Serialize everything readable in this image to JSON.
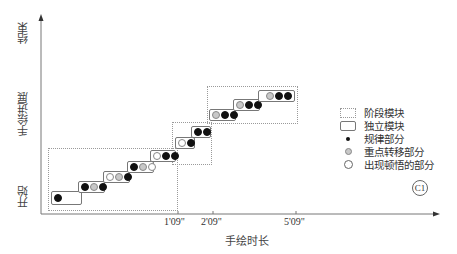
{
  "diagram": {
    "y_axis": {
      "top_label": "结束",
      "middle_label": "手绘进展",
      "bottom_label": "开始"
    },
    "x_axis": {
      "label": "手绘时长",
      "ticks": [
        "1'09\"",
        "2'09\"",
        "5'09\""
      ]
    },
    "legend": {
      "items": [
        {
          "symbol": "dotted-rect",
          "label": "阶段模块"
        },
        {
          "symbol": "solid-rect",
          "label": "独立模块"
        },
        {
          "symbol": "black-dot",
          "label": "规律部分"
        },
        {
          "symbol": "gray-dot",
          "label": "重点转移部分"
        },
        {
          "symbol": "hollow-dot",
          "label": "出现顿悟的部分"
        }
      ]
    },
    "badge": "C1",
    "stages": [
      {
        "name": "stage-1",
        "blocks": [
          [
            "regular"
          ],
          [
            "regular",
            "focus",
            "regular"
          ],
          [
            "insight",
            "focus",
            "regular"
          ],
          [
            "regular",
            "focus",
            "insight"
          ],
          [
            "insight",
            "regular",
            "regular"
          ]
        ]
      },
      {
        "name": "stage-2",
        "blocks": [
          [
            "insight",
            "regular"
          ],
          [
            "regular",
            "regular"
          ]
        ]
      },
      {
        "name": "stage-3",
        "blocks": [
          [
            "focus",
            "regular",
            "regular"
          ],
          [
            "focus",
            "regular",
            "regular"
          ],
          [
            "focus",
            "regular",
            "regular"
          ]
        ]
      }
    ],
    "colors": {
      "regular": "#111111",
      "focus": "#c8c8c8",
      "insight": "#ffffff",
      "axis": "#666666"
    }
  }
}
